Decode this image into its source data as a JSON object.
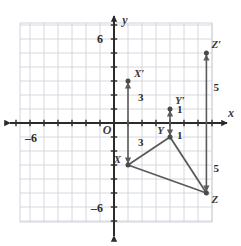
{
  "figure": {
    "type": "coordinate-plane-translation-diagram",
    "background": "#ffffff",
    "grid_color": "#cfd4da",
    "axis_color": "#2b2b2b",
    "shape_color": "#5a5a5a",
    "arrow_color": "#5a5a5a",
    "label_color": "#3a3a3a"
  },
  "axes": {
    "x_label": "x",
    "y_label": "y",
    "origin_label": "O",
    "x_tick_label_neg": "–6",
    "y_tick_label_pos": "6",
    "y_tick_label_neg": "–6",
    "x_range": [
      -6.7,
      7.0
    ],
    "y_range": [
      -7.1,
      7.1
    ],
    "unit_px": 14
  },
  "points": {
    "X": {
      "label": "X",
      "x": 1.0,
      "y": -3.0
    },
    "Y": {
      "label": "Y",
      "x": 4.0,
      "y": -1.0
    },
    "Z": {
      "label": "Z",
      "x": 6.6,
      "y": -5.0
    },
    "Xp": {
      "label": "X′",
      "x": 1.0,
      "y": 3.0
    },
    "Yp": {
      "label": "Y′",
      "x": 4.0,
      "y": 1.0
    },
    "Zp": {
      "label": "Z′",
      "x": 6.6,
      "y": 5.0
    }
  },
  "measures": {
    "x_upper": "3",
    "x_lower": "3",
    "y_upper": "1",
    "y_lower": "1",
    "z_upper": "5",
    "z_lower": "5"
  },
  "chart_data": {
    "type": "scatter",
    "title": "",
    "xlabel": "x",
    "ylabel": "y",
    "xlim": [
      -6.7,
      7.0
    ],
    "ylim": [
      -7.1,
      7.1
    ],
    "grid": true,
    "legend": null,
    "series": [
      {
        "name": "Triangle XYZ (preimage)",
        "points": [
          {
            "label": "X",
            "x": 1.0,
            "y": -3.0
          },
          {
            "label": "Y",
            "x": 4.0,
            "y": -1.0
          },
          {
            "label": "Z",
            "x": 6.6,
            "y": -5.0
          }
        ],
        "closed": true
      },
      {
        "name": "Triangle X'Y'Z' (image vertices)",
        "points": [
          {
            "label": "X′",
            "x": 1.0,
            "y": 3.0
          },
          {
            "label": "Y′",
            "x": 4.0,
            "y": 1.0
          },
          {
            "label": "Z′",
            "x": 6.6,
            "y": 5.0
          }
        ],
        "closed": false
      }
    ],
    "annotations": [
      {
        "text": "3",
        "x": 1.7,
        "y": 1.6
      },
      {
        "text": "3",
        "x": 1.7,
        "y": -1.6
      },
      {
        "text": "1",
        "x": 4.7,
        "y": 0.9
      },
      {
        "text": "1",
        "x": 4.7,
        "y": -1.0
      },
      {
        "text": "5",
        "x": 7.2,
        "y": 2.5
      },
      {
        "text": "5",
        "x": 7.2,
        "y": -3.4
      }
    ]
  }
}
